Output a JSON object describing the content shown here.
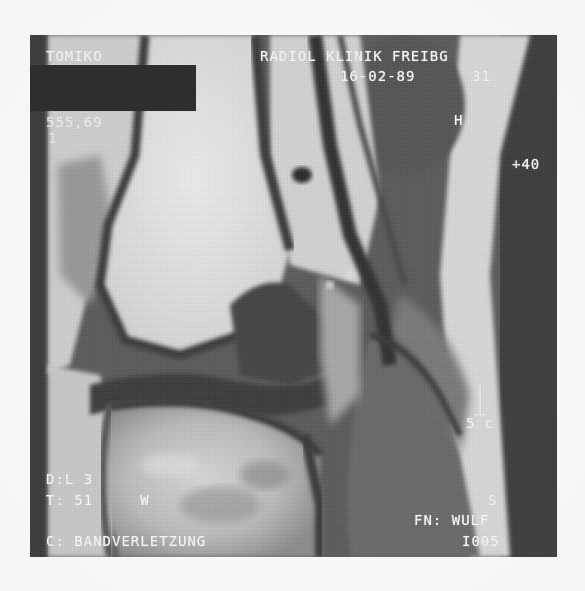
{
  "image": {
    "description": "Sagittal knee MRI scan (grayscale), photocopied",
    "colors": {
      "page_background": "#fbfbfb",
      "frame_dark": "#3a3a3a",
      "bone_marrow_bright": "#e6e6e6",
      "soft_tissue_gray": "#707070",
      "text_overlay": "#f2f2f2",
      "redaction": "#2e2e2e"
    }
  },
  "overlays": {
    "top_left": {
      "patient_name": "TOMIKO",
      "line2": "555,69",
      "line3": "1"
    },
    "top_right": {
      "institution": "RADIOL KLINIK FREIBG",
      "date_time": "16-02-89      31",
      "marker_h": "H",
      "value": "+40"
    },
    "right_scale": {
      "scale_label": "5 c"
    },
    "bottom_left": {
      "line1": "D:L 3",
      "line2": "T: 51     W",
      "comment": "C: BANDVERLETZUNG"
    },
    "bottom_right": {
      "orientation": "S",
      "fn": "FN: WULF",
      "image_number": "I005"
    }
  }
}
